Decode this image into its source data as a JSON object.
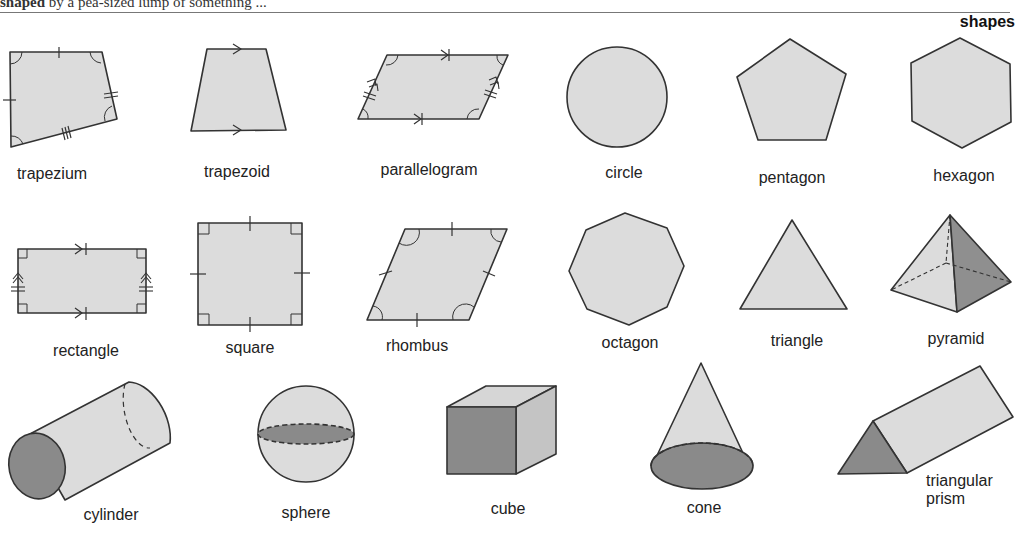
{
  "header": {
    "cut_text_bold": "shaped",
    "cut_text_rest": " by a pea-sized lump of something ...",
    "section_title": "shapes"
  },
  "colors": {
    "fill_light": "#dcdcdc",
    "fill_dark": "#8a8a8a",
    "fill_mid": "#c4c4c4",
    "stroke": "#333333"
  },
  "shapes": [
    {
      "id": "trapezium",
      "label": "trapezium"
    },
    {
      "id": "trapezoid",
      "label": "trapezoid"
    },
    {
      "id": "parallelogram",
      "label": "parallelogram"
    },
    {
      "id": "circle",
      "label": "circle"
    },
    {
      "id": "pentagon",
      "label": "pentagon"
    },
    {
      "id": "hexagon",
      "label": "hexagon"
    },
    {
      "id": "rectangle",
      "label": "rectangle"
    },
    {
      "id": "square",
      "label": "square"
    },
    {
      "id": "rhombus",
      "label": "rhombus"
    },
    {
      "id": "octagon",
      "label": "octagon"
    },
    {
      "id": "triangle",
      "label": "triangle"
    },
    {
      "id": "pyramid",
      "label": "pyramid"
    },
    {
      "id": "cylinder",
      "label": "cylinder"
    },
    {
      "id": "sphere",
      "label": "sphere"
    },
    {
      "id": "cube",
      "label": "cube"
    },
    {
      "id": "cone",
      "label": "cone"
    },
    {
      "id": "triangular-prism",
      "label": "triangular\nprism",
      "label_line1": "triangular",
      "label_line2": "prism"
    }
  ]
}
